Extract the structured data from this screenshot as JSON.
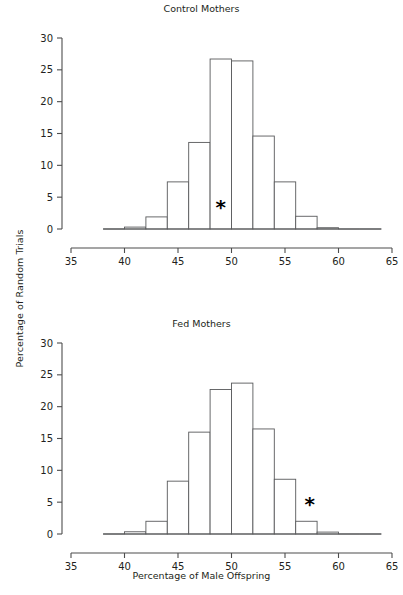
{
  "figure": {
    "xlabel": "Percentage of Male Offspring",
    "ylabel": "Percentage of Random Trials",
    "panels": [
      {
        "id": "top",
        "title": "Control Mothers"
      },
      {
        "id": "bot",
        "title": "Fed Mothers"
      }
    ]
  },
  "axis": {
    "x_ticks": [
      "35",
      "40",
      "45",
      "50",
      "55",
      "60",
      "65"
    ],
    "y_ticks": [
      "0",
      "5",
      "10",
      "15",
      "20",
      "25",
      "30"
    ],
    "x_tick_values": [
      35,
      40,
      45,
      50,
      55,
      60,
      65
    ],
    "y_tick_values": [
      0,
      5,
      10,
      15,
      20,
      25,
      30
    ]
  },
  "chart_data": [
    {
      "type": "bar",
      "title": "Control Mothers",
      "xlabel": "Percentage of Male Offspring",
      "ylabel": "Percentage of Random Trials",
      "xlim": [
        35,
        65
      ],
      "ylim": [
        0,
        30
      ],
      "bin_width": 2,
      "grid": false,
      "legend": "none",
      "bin_starts": [
        38,
        40,
        42,
        44,
        46,
        48,
        50,
        52,
        54,
        56,
        58,
        60,
        62
      ],
      "categories": [
        "38-40",
        "40-42",
        "42-44",
        "44-46",
        "46-48",
        "48-50",
        "50-52",
        "52-54",
        "54-56",
        "56-58",
        "58-60",
        "60-62",
        "62-64"
      ],
      "values": [
        0.1,
        0.3,
        1.9,
        7.4,
        13.6,
        26.7,
        26.4,
        14.6,
        7.4,
        2.0,
        0.2,
        0.05,
        0.0
      ],
      "annotations": [
        {
          "label": "*",
          "x": 49.0,
          "y": 2.4,
          "symbol": "asterisk",
          "meaning": "observed-value-marker"
        }
      ]
    },
    {
      "type": "bar",
      "title": "Fed Mothers",
      "xlabel": "Percentage of Male Offspring",
      "ylabel": "Percentage of Random Trials",
      "xlim": [
        35,
        65
      ],
      "ylim": [
        0,
        30
      ],
      "bin_width": 2,
      "grid": false,
      "legend": "none",
      "bin_starts": [
        38,
        40,
        42,
        44,
        46,
        48,
        50,
        52,
        54,
        56,
        58,
        60,
        62
      ],
      "categories": [
        "38-40",
        "40-42",
        "42-44",
        "44-46",
        "46-48",
        "48-50",
        "50-52",
        "52-54",
        "54-56",
        "56-58",
        "58-60",
        "60-62",
        "62-64"
      ],
      "values": [
        0.1,
        0.35,
        2.0,
        8.3,
        16.0,
        22.7,
        23.7,
        16.5,
        8.6,
        2.0,
        0.3,
        0.05,
        0.0
      ],
      "annotations": [
        {
          "label": "*",
          "x": 57.3,
          "y": 3.6,
          "symbol": "asterisk",
          "meaning": "observed-value-marker"
        }
      ]
    }
  ],
  "colors": {
    "bar_stroke": "#58595b",
    "bar_fill": "#ffffff",
    "axis": "#4d4d4d",
    "text": "#231f20",
    "annotation": "#000000",
    "background": "#ffffff"
  }
}
